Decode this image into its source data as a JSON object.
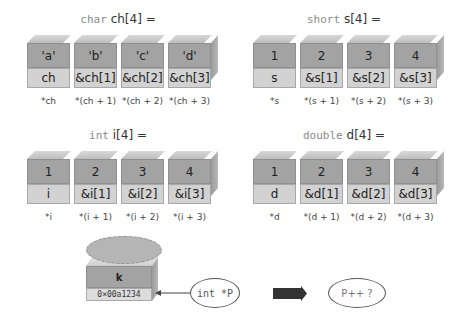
{
  "arrays": [
    {
      "id": "char",
      "type_kw": "char",
      "decl": "ch[4] =",
      "values": [
        "'a'",
        "'b'",
        "'c'",
        "'d'"
      ],
      "addresses": [
        "ch",
        "&ch[1]",
        "&ch[2]",
        "&ch[3]"
      ],
      "derefs": [
        "*ch",
        "*(ch + 1)",
        "*(ch + 2)",
        "*(ch + 3)"
      ]
    },
    {
      "id": "short",
      "type_kw": "short",
      "decl": "s[4] =",
      "values": [
        "1",
        "2",
        "3",
        "4"
      ],
      "addresses": [
        "s",
        "&s[1]",
        "&s[2]",
        "&s[3]"
      ],
      "derefs": [
        "*s",
        "*(s + 1)",
        "*(s + 2)",
        "*(s + 3)"
      ]
    },
    {
      "id": "int",
      "type_kw": "int",
      "decl": "i[4] =",
      "values": [
        "1",
        "2",
        "3",
        "4"
      ],
      "addresses": [
        "i",
        "&i[1]",
        "&i[2]",
        "&i[3]"
      ],
      "derefs": [
        "*i",
        "*(i + 1)",
        "*(i + 2)",
        "*(i + 3)"
      ]
    },
    {
      "id": "double",
      "type_kw": "double",
      "decl": "d[4] =",
      "values": [
        "1",
        "2",
        "3",
        "4"
      ],
      "addresses": [
        "d",
        "&d[1]",
        "&d[2]",
        "&d[3]"
      ],
      "derefs": [
        "*d",
        "*(d + 1)",
        "*(d + 2)",
        "*(d + 3)"
      ]
    }
  ],
  "pointer_demo": {
    "variable_name": "k",
    "address": "0×00a1234",
    "pointer_decl": "int *P",
    "question": "P++ ?"
  },
  "colors": {
    "upper_box": "#a3a3a3",
    "lower_box": "#d2d2d2",
    "top_face": "#c8c8c8",
    "ellipse": "#b5b5b5",
    "arrow": "#333333"
  }
}
